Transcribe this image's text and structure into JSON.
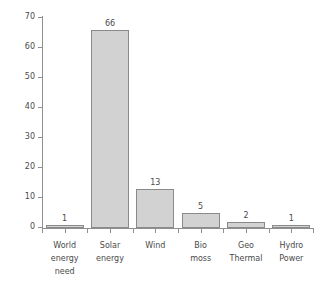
{
  "chart_data": {
    "type": "bar",
    "title": "",
    "subtitle": "",
    "xlabel": "",
    "ylabel": "",
    "categories": [
      "World energy need",
      "Solar energy",
      "Wind",
      "Bio moss",
      "Geo Thermal",
      "Hydro Power"
    ],
    "category_lines": [
      [
        "World",
        "energy",
        "need"
      ],
      [
        "Solar",
        "energy"
      ],
      [
        "Wind"
      ],
      [
        "Bio",
        "moss"
      ],
      [
        "Geo",
        "Thermal"
      ],
      [
        "Hydro",
        "Power"
      ]
    ],
    "values": [
      1,
      66,
      13,
      5,
      2,
      1
    ],
    "value_labels": [
      "1",
      "66",
      "13",
      "5",
      "2",
      "1"
    ],
    "ylim": [
      0,
      70
    ],
    "yticks": [
      0,
      10,
      20,
      30,
      40,
      50,
      60,
      70
    ],
    "ytick_labels": [
      "0",
      "10",
      "20",
      "30",
      "40",
      "50",
      "60",
      "70"
    ],
    "grid": false,
    "legend": false,
    "legend_position": "none",
    "bar_fill_color": "#d2d2d2",
    "bar_edge_color": "#8a8a8a",
    "axis_color": "#8f8f8f",
    "text_color": "#4a4a4a",
    "background_color": "#ffffff"
  }
}
